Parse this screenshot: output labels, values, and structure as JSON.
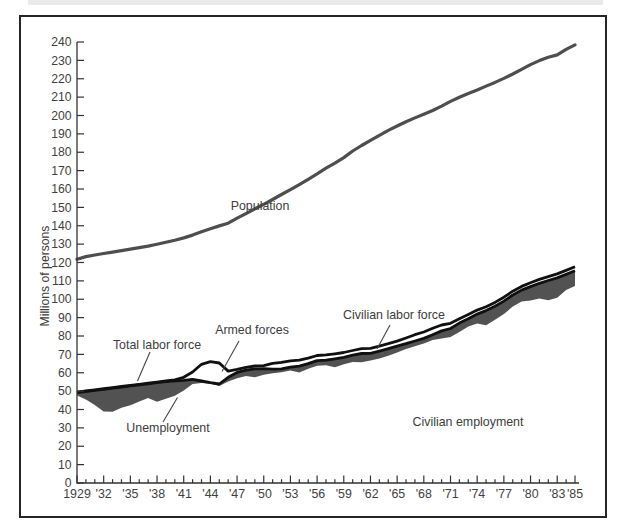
{
  "figure": {
    "background": "#ffffff",
    "frame_border_color": "#262626",
    "axis_color": "#333333",
    "tick_label_color": "#3f3f3f",
    "annotation_color": "#3d3d3d"
  },
  "labels": {
    "y_axis_title": "Millions of persons",
    "population": "Population",
    "total_labor_force": "Total labor force",
    "armed_forces": "Armed forces",
    "unemployment": "Unemployment",
    "civilian_labor_force": "Civilian labor force",
    "civilian_employment": "Civilian employment"
  },
  "chart_data": {
    "type": "line",
    "title": "",
    "xlabel": "",
    "ylabel": "Millions of persons",
    "grid": false,
    "legend_position": "none (inline annotations with leader lines)",
    "xlim": [
      1929,
      1985
    ],
    "ylim": [
      0,
      240
    ],
    "y_tick_step": 10,
    "x_major_tick_years": [
      1929,
      1932,
      1935,
      1938,
      1941,
      1944,
      1947,
      1950,
      1953,
      1956,
      1959,
      1962,
      1965,
      1968,
      1971,
      1974,
      1977,
      1980,
      1983,
      1985
    ],
    "x_tick_labels": [
      "1929",
      "'32",
      "'35",
      "'38",
      "'41",
      "'44",
      "'47",
      "'50",
      "'53",
      "'56",
      "'59",
      "'62",
      "'65",
      "'68",
      "'71",
      "'74",
      "'77",
      "'80",
      "'83",
      "'85"
    ],
    "x_minor_tick_every_years": 1,
    "x": [
      1929,
      1930,
      1931,
      1932,
      1933,
      1934,
      1935,
      1936,
      1937,
      1938,
      1939,
      1940,
      1941,
      1942,
      1943,
      1944,
      1945,
      1946,
      1947,
      1948,
      1949,
      1950,
      1951,
      1952,
      1953,
      1954,
      1955,
      1956,
      1957,
      1958,
      1959,
      1960,
      1961,
      1962,
      1963,
      1964,
      1965,
      1966,
      1967,
      1968,
      1969,
      1970,
      1971,
      1972,
      1973,
      1974,
      1975,
      1976,
      1977,
      1978,
      1979,
      1980,
      1981,
      1982,
      1983,
      1984,
      1985
    ],
    "series": [
      {
        "name": "Population",
        "style": "line",
        "color": "#4e4e4e",
        "width": 3.2,
        "values": [
          121.8,
          123.2,
          124.1,
          124.9,
          125.6,
          126.4,
          127.3,
          128.1,
          128.9,
          129.9,
          131.0,
          132.1,
          133.4,
          134.9,
          136.7,
          138.4,
          139.9,
          141.4,
          144.1,
          146.6,
          149.2,
          151.7,
          154.3,
          157.0,
          159.6,
          162.4,
          165.3,
          168.2,
          171.3,
          174.1,
          177.1,
          180.7,
          183.7,
          186.5,
          189.2,
          191.9,
          194.3,
          196.6,
          198.7,
          200.7,
          202.7,
          205.1,
          207.7,
          209.9,
          211.9,
          213.9,
          216.0,
          218.0,
          220.2,
          222.6,
          225.1,
          227.7,
          229.9,
          231.7,
          233.0,
          236.0,
          238.5
        ]
      },
      {
        "name": "Total labor force",
        "style": "line",
        "color": "#101010",
        "width": 2.8,
        "values": [
          49.4,
          50.1,
          50.7,
          51.3,
          51.9,
          52.5,
          53.1,
          53.7,
          54.3,
          54.9,
          55.5,
          56.1,
          57.5,
          60.4,
          64.6,
          66.0,
          65.3,
          60.9,
          61.8,
          62.9,
          63.7,
          63.9,
          65.1,
          65.7,
          66.5,
          66.9,
          68.0,
          69.4,
          69.7,
          70.3,
          71.0,
          72.1,
          73.1,
          73.3,
          74.5,
          75.8,
          77.2,
          78.9,
          80.7,
          82.2,
          84.2,
          86.0,
          86.9,
          89.4,
          91.7,
          94.1,
          95.9,
          98.3,
          101.1,
          104.4,
          107.0,
          109.0,
          110.8,
          112.3,
          113.8,
          115.7,
          117.7
        ]
      },
      {
        "name": "Civilian labor force",
        "style": "line",
        "color": "#101010",
        "width": 2.8,
        "values": [
          49.2,
          49.8,
          50.4,
          51.0,
          51.6,
          52.2,
          52.9,
          53.4,
          54.0,
          54.6,
          55.2,
          55.6,
          55.9,
          56.4,
          55.5,
          54.6,
          53.9,
          57.5,
          60.2,
          61.4,
          62.1,
          62.2,
          62.0,
          62.1,
          63.0,
          63.6,
          65.0,
          66.6,
          66.9,
          67.6,
          68.4,
          69.6,
          70.5,
          70.6,
          71.8,
          73.1,
          74.5,
          75.8,
          77.3,
          78.7,
          80.7,
          82.8,
          84.1,
          87.0,
          89.4,
          91.9,
          93.8,
          96.2,
          99.0,
          102.3,
          105.0,
          106.9,
          108.7,
          110.2,
          111.6,
          113.5,
          115.5
        ]
      },
      {
        "name": "Civilian employment",
        "style": "area-lower-bound",
        "color": "#525252",
        "width": 0,
        "values": [
          47.6,
          45.5,
          42.4,
          38.9,
          38.8,
          40.9,
          42.3,
          44.4,
          46.3,
          44.2,
          45.8,
          47.5,
          50.4,
          53.8,
          54.5,
          54.0,
          52.8,
          55.3,
          57.0,
          58.3,
          57.6,
          58.9,
          59.7,
          60.3,
          61.2,
          60.1,
          62.2,
          63.8,
          64.1,
          63.0,
          64.6,
          65.8,
          65.7,
          66.7,
          67.8,
          69.3,
          71.1,
          72.9,
          74.4,
          75.9,
          77.9,
          78.7,
          79.4,
          82.2,
          85.1,
          86.8,
          85.8,
          88.8,
          92.0,
          96.0,
          98.8,
          99.3,
          100.4,
          99.5,
          100.8,
          105.0,
          107.2
        ]
      }
    ],
    "shaded_regions": [
      {
        "name": "Unemployment",
        "between": [
          "Civilian labor force",
          "Civilian employment"
        ],
        "fill": "#525252"
      },
      {
        "name": "Armed forces",
        "between": [
          "Total labor force",
          "Civilian labor force"
        ],
        "fill": "#ffffff"
      }
    ]
  }
}
